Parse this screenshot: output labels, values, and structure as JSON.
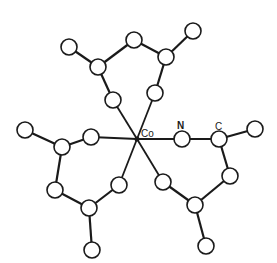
{
  "diagram": {
    "type": "molecular-structure",
    "center_atom": {
      "label": "Co",
      "x": 137,
      "y": 139
    },
    "labels": [
      {
        "id": "label-co",
        "text": "Co",
        "x": 141,
        "y": 137
      },
      {
        "id": "label-n",
        "text": "N",
        "x": 177,
        "y": 129
      },
      {
        "id": "label-c",
        "text": "C",
        "x": 215,
        "y": 130
      }
    ],
    "atom_radius": 8,
    "colors": {
      "stroke": "#1a1a1a",
      "fill": "#ffffff",
      "background": "#ffffff"
    },
    "atoms": [
      {
        "id": "a1",
        "x": 69,
        "y": 47
      },
      {
        "id": "a2",
        "x": 98,
        "y": 67
      },
      {
        "id": "a3",
        "x": 134,
        "y": 40
      },
      {
        "id": "a4",
        "x": 166,
        "y": 57
      },
      {
        "id": "a5",
        "x": 193,
        "y": 31
      },
      {
        "id": "a6",
        "x": 155,
        "y": 93
      },
      {
        "id": "a7",
        "x": 113,
        "y": 100
      },
      {
        "id": "b1",
        "x": 25,
        "y": 130
      },
      {
        "id": "b2",
        "x": 62,
        "y": 147
      },
      {
        "id": "b3",
        "x": 91,
        "y": 137
      },
      {
        "id": "b4",
        "x": 55,
        "y": 190
      },
      {
        "id": "b5",
        "x": 89,
        "y": 208
      },
      {
        "id": "b6",
        "x": 119,
        "y": 185
      },
      {
        "id": "b7",
        "x": 92,
        "y": 250
      },
      {
        "id": "n1",
        "x": 182,
        "y": 139
      },
      {
        "id": "c1",
        "x": 219,
        "y": 139
      },
      {
        "id": "c2",
        "x": 255,
        "y": 129
      },
      {
        "id": "c3",
        "x": 230,
        "y": 176
      },
      {
        "id": "c4",
        "x": 195,
        "y": 205
      },
      {
        "id": "c5",
        "x": 163,
        "y": 182
      },
      {
        "id": "c6",
        "x": 206,
        "y": 246
      }
    ],
    "bonds": [
      [
        "a1",
        "a2"
      ],
      [
        "a2",
        "a3"
      ],
      [
        "a3",
        "a4"
      ],
      [
        "a4",
        "a5"
      ],
      [
        "a4",
        "a6"
      ],
      [
        "a2",
        "a7"
      ],
      [
        "b1",
        "b2"
      ],
      [
        "b2",
        "b3"
      ],
      [
        "b2",
        "b4"
      ],
      [
        "b4",
        "b5"
      ],
      [
        "b5",
        "b6"
      ],
      [
        "b5",
        "b7"
      ],
      [
        "n1",
        "c1"
      ],
      [
        "c1",
        "c2"
      ],
      [
        "c1",
        "c3"
      ],
      [
        "c3",
        "c4"
      ],
      [
        "c4",
        "c5"
      ],
      [
        "c4",
        "c6"
      ]
    ],
    "metal_bonds": [
      "a6",
      "a7",
      "b3",
      "b6",
      "n1",
      "c5"
    ]
  }
}
